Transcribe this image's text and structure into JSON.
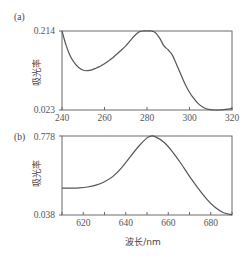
{
  "chart_data": [
    {
      "panel": "(a)",
      "type": "line",
      "title": "",
      "xlabel": "",
      "ylabel": "吸光率",
      "xlim": [
        240,
        320
      ],
      "ylim": [
        0.023,
        0.214
      ],
      "xticks": [
        240,
        260,
        280,
        300,
        320
      ],
      "yticks": [
        0.023,
        0.214
      ],
      "ytick_labels": [
        "0.023",
        "0.214"
      ],
      "grid": false,
      "x": [
        240,
        242,
        244,
        246,
        248,
        250,
        252,
        254,
        256,
        258,
        260,
        262,
        264,
        266,
        268,
        270,
        272,
        274,
        276,
        278,
        280,
        282,
        284,
        286,
        288,
        290,
        292,
        294,
        296,
        298,
        300,
        302,
        304,
        306,
        308,
        310,
        312,
        314,
        316,
        318,
        320
      ],
      "series": [
        {
          "name": "absorbance",
          "values": [
            0.214,
            0.178,
            0.152,
            0.136,
            0.125,
            0.119,
            0.118,
            0.12,
            0.124,
            0.129,
            0.135,
            0.142,
            0.15,
            0.159,
            0.168,
            0.178,
            0.19,
            0.202,
            0.211,
            0.214,
            0.214,
            0.214,
            0.21,
            0.196,
            0.178,
            0.168,
            0.155,
            0.132,
            0.108,
            0.085,
            0.066,
            0.051,
            0.039,
            0.031,
            0.026,
            0.024,
            0.023,
            0.023,
            0.024,
            0.025,
            0.027
          ]
        }
      ]
    },
    {
      "panel": "(b)",
      "type": "line",
      "title": "",
      "xlabel": "波长/nm",
      "ylabel": "吸光率",
      "xlim": [
        610,
        690
      ],
      "ylim": [
        0.038,
        0.778
      ],
      "xticks": [
        620,
        640,
        660,
        680
      ],
      "yticks": [
        0.038,
        0.778
      ],
      "ytick_labels": [
        "0.038",
        "0.778"
      ],
      "grid": false,
      "x": [
        610,
        614,
        618,
        622,
        626,
        630,
        634,
        638,
        642,
        646,
        650,
        652,
        654,
        658,
        662,
        666,
        670,
        674,
        678,
        682,
        686,
        690
      ],
      "series": [
        {
          "name": "absorbance",
          "values": [
            0.29,
            0.29,
            0.292,
            0.3,
            0.318,
            0.35,
            0.4,
            0.48,
            0.58,
            0.68,
            0.76,
            0.778,
            0.77,
            0.72,
            0.63,
            0.52,
            0.4,
            0.29,
            0.19,
            0.11,
            0.06,
            0.04
          ]
        }
      ]
    }
  ],
  "panels": {
    "a": {
      "label": "(a)",
      "ylabel": "吸光率",
      "ymax_label": "0.214",
      "ymin_label": "0.023",
      "xtick_labels": [
        "240",
        "260",
        "280",
        "300",
        "320"
      ]
    },
    "b": {
      "label": "(b)",
      "ylabel": "吸光率",
      "ymax_label": "0.778",
      "ymin_label": "0.038",
      "xtick_labels": [
        "620",
        "640",
        "660",
        "680"
      ],
      "xlabel": "波长/nm"
    }
  },
  "colors": {
    "axis": "#6a6a6a",
    "curve": "#555555"
  }
}
